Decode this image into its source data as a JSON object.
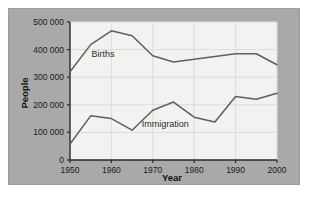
{
  "figure": {
    "panel_color": "#a9a9a7",
    "page_color": "#ffffff",
    "plot_bg_color": "#f2f2f0",
    "line_color": "#5f5f5f",
    "grid_color": "#dcdcd8",
    "axis_color": "#2b2b2b"
  },
  "chart_data": {
    "type": "line",
    "title": "",
    "xlabel": "Year",
    "ylabel": "People",
    "xlim": [
      1950,
      2000
    ],
    "ylim": [
      0,
      500000
    ],
    "grid": true,
    "legend_position": "inline-labels",
    "xticks": [
      1950,
      1960,
      1970,
      1980,
      1990,
      2000
    ],
    "xtick_labels": [
      "1950",
      "1960",
      "1970",
      "1980",
      "1990",
      "2000"
    ],
    "yticks": [
      0,
      100000,
      200000,
      300000,
      400000,
      500000
    ],
    "ytick_labels": [
      "0",
      "100 000",
      "200 000",
      "300 000",
      "400 000",
      "500 000"
    ],
    "x": [
      1950,
      1955,
      1960,
      1965,
      1970,
      1975,
      1980,
      1985,
      1990,
      1995,
      2000
    ],
    "series": [
      {
        "name": "Births",
        "label": "Births",
        "label_x": 1958,
        "label_y": 372000,
        "values": [
          320000,
          418000,
          468000,
          450000,
          378000,
          355000,
          365000,
          375000,
          385000,
          385000,
          345000
        ]
      },
      {
        "name": "Immigration",
        "label": "Immigration",
        "label_x": 1973,
        "label_y": 118000,
        "values": [
          58000,
          160000,
          150000,
          108000,
          180000,
          210000,
          155000,
          138000,
          230000,
          220000,
          242000
        ]
      }
    ]
  }
}
